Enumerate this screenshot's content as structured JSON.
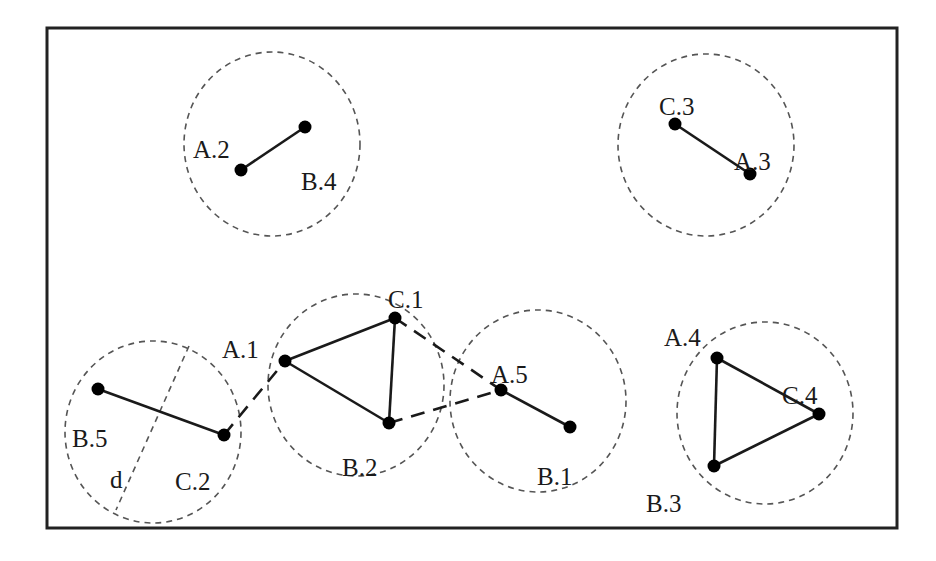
{
  "diagram": {
    "frame": {
      "x": 47,
      "y": 28,
      "width": 850,
      "height": 500,
      "stroke": "#222222"
    },
    "colors": {
      "node": "#000000",
      "edge": "#1a1a1a",
      "circle": "#555555",
      "label": "#1a1a1a"
    },
    "clusters": [
      {
        "id": "cluster-1",
        "cx": 272,
        "cy": 144,
        "rx": 88,
        "ry": 92,
        "nodes": [
          "A.2",
          "B.4"
        ]
      },
      {
        "id": "cluster-2",
        "cx": 706,
        "cy": 145,
        "rx": 88,
        "ry": 91,
        "nodes": [
          "C.3",
          "A.3"
        ]
      },
      {
        "id": "cluster-3",
        "cx": 153,
        "cy": 432,
        "rx": 88,
        "ry": 91,
        "nodes": [
          "B.5",
          "C.2"
        ],
        "diameter_label": "d"
      },
      {
        "id": "cluster-4",
        "cx": 356,
        "cy": 385,
        "rx": 88,
        "ry": 91,
        "nodes": [
          "A.1",
          "C.1",
          "B.2"
        ]
      },
      {
        "id": "cluster-5",
        "cx": 538,
        "cy": 401,
        "rx": 88,
        "ry": 91,
        "nodes": [
          "A.5",
          "B.1"
        ]
      },
      {
        "id": "cluster-6",
        "cx": 765,
        "cy": 413,
        "rx": 88,
        "ry": 91,
        "nodes": [
          "A.4",
          "C.4",
          "B.3"
        ]
      }
    ],
    "nodes": {
      "A2": {
        "label": "A.2",
        "x": 241,
        "y": 170,
        "lx": 193,
        "ly": 140
      },
      "B4": {
        "label": "B.4",
        "x": 305,
        "y": 127,
        "lx": 301,
        "ly": 172
      },
      "C3": {
        "label": "C.3",
        "x": 675,
        "y": 124,
        "lx": 659,
        "ly": 97
      },
      "A3": {
        "label": "A.3",
        "x": 750,
        "y": 174,
        "lx": 734,
        "ly": 152
      },
      "B5": {
        "label": "B.5",
        "x": 98,
        "y": 389,
        "lx": 72,
        "ly": 429
      },
      "C2": {
        "label": "C.2",
        "x": 224,
        "y": 435,
        "lx": 175,
        "ly": 472
      },
      "A1": {
        "label": "A.1",
        "x": 285,
        "y": 361,
        "lx": 222,
        "ly": 340
      },
      "C1": {
        "label": "C.1",
        "x": 395,
        "y": 318,
        "lx": 388,
        "ly": 290
      },
      "B2": {
        "label": "B.2",
        "x": 389,
        "y": 423,
        "lx": 342,
        "ly": 458
      },
      "A5": {
        "label": "A.5",
        "x": 501,
        "y": 390,
        "lx": 491,
        "ly": 365
      },
      "B1": {
        "label": "B.1",
        "x": 570,
        "y": 427,
        "lx": 537,
        "ly": 467
      },
      "A4": {
        "label": "A.4",
        "x": 717,
        "y": 358,
        "lx": 664,
        "ly": 328
      },
      "C4": {
        "label": "C.4",
        "x": 819,
        "y": 414,
        "lx": 782,
        "ly": 386
      },
      "B3": {
        "label": "B.3",
        "x": 714,
        "y": 466,
        "lx": 646,
        "ly": 494
      }
    },
    "solid_edges": [
      [
        "A2",
        "B4"
      ],
      [
        "C3",
        "A3"
      ],
      [
        "B5",
        "C2"
      ],
      [
        "A1",
        "C1"
      ],
      [
        "A1",
        "B2"
      ],
      [
        "C1",
        "B2"
      ],
      [
        "A5",
        "B1"
      ],
      [
        "A4",
        "C4"
      ],
      [
        "A4",
        "B3"
      ],
      [
        "C4",
        "B3"
      ]
    ],
    "dashed_edges": [
      [
        "C2",
        "A1"
      ],
      [
        "C1",
        "A5"
      ],
      [
        "B2",
        "A5"
      ]
    ],
    "diameter": {
      "x1": 189,
      "y1": 346,
      "x2": 116,
      "y2": 510,
      "label": "d",
      "lx": 110,
      "ly": 470
    }
  }
}
